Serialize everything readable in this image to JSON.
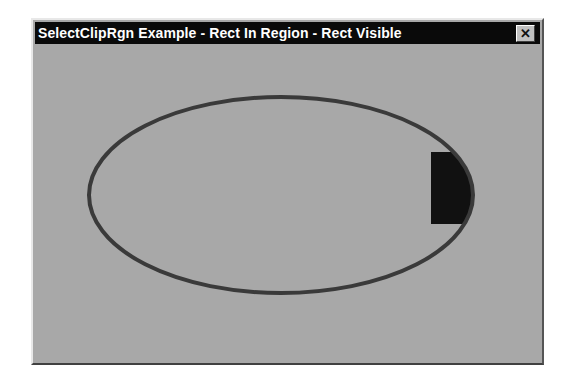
{
  "window": {
    "title": "SelectClipRgn Example - Rect In Region - Rect Visible",
    "close_label": "✕"
  },
  "drawing": {
    "ellipse": {
      "cx": 281,
      "cy": 195,
      "rx": 192,
      "ry": 98,
      "stroke": "#3a3a3a",
      "stroke_width": 4
    },
    "rect": {
      "x": 431,
      "y": 152,
      "width": 60,
      "height": 72,
      "fill": "#111111",
      "clipped_to": "ellipse"
    },
    "background": "#a8a8a8"
  }
}
